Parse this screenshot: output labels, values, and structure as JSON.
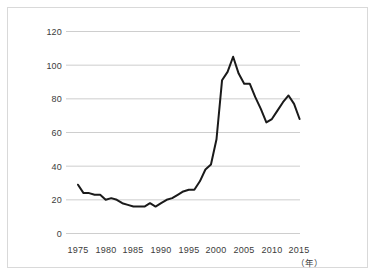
{
  "chart_data": {
    "type": "line",
    "title": "",
    "subtitle": "",
    "xlabel": "（年）",
    "ylabel": "",
    "xlim": [
      1975,
      2015
    ],
    "ylim": [
      0,
      120
    ],
    "grid": true,
    "grid_axis": "y",
    "legend": false,
    "legend_position": "none",
    "x_ticks": [
      "1975",
      "1980",
      "1985",
      "1990",
      "1995",
      "2000",
      "2005",
      "2010",
      "2015"
    ],
    "x_tick_values": [
      1975,
      1980,
      1985,
      1990,
      1995,
      2000,
      2005,
      2010,
      2015
    ],
    "y_ticks": [
      "0",
      "20",
      "40",
      "60",
      "80",
      "100",
      "120"
    ],
    "y_tick_values": [
      0,
      20,
      40,
      60,
      80,
      100,
      120
    ],
    "series": [
      {
        "name": "series-1",
        "color": "#1a1a1a",
        "x": [
          1975,
          1976,
          1977,
          1978,
          1979,
          1980,
          1981,
          1982,
          1983,
          1984,
          1985,
          1986,
          1987,
          1988,
          1989,
          1990,
          1991,
          1992,
          1993,
          1994,
          1995,
          1996,
          1997,
          1998,
          1999,
          2000,
          2001,
          2002,
          2003,
          2004,
          2005,
          2006,
          2007,
          2008,
          2009,
          2010,
          2011,
          2012,
          2013,
          2014,
          2015
        ],
        "values": [
          29,
          24,
          24,
          23,
          23,
          20,
          21,
          20,
          18,
          17,
          16,
          16,
          16,
          18,
          16,
          18,
          20,
          21,
          23,
          25,
          26,
          26,
          31,
          38,
          41,
          56,
          91,
          96,
          105,
          95,
          89,
          89,
          81,
          74,
          66,
          68,
          73,
          78,
          82,
          77,
          68
        ]
      }
    ]
  },
  "axes": {
    "x_unit": "（年）"
  }
}
